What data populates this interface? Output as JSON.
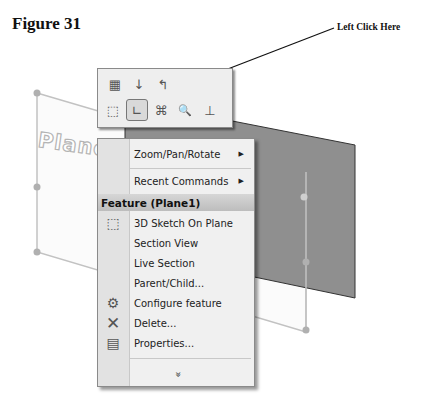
{
  "figure": {
    "label": "Figure 31"
  },
  "callout": {
    "label": "Left Click Here",
    "target": "sketch-button"
  },
  "scene": {
    "plane_label": "Plane",
    "plane_color": "#8f8f8f"
  },
  "toolbar": {
    "row1": [
      {
        "name": "edit-feature-icon",
        "glyph": "▦"
      },
      {
        "name": "rollback-icon",
        "glyph": "↓"
      },
      {
        "name": "undo-icon",
        "glyph": "↰"
      }
    ],
    "row2": [
      {
        "name": "select-other-icon",
        "glyph": "⬚"
      },
      {
        "name": "sketch-icon",
        "glyph": "∟",
        "active": true
      },
      {
        "name": "normal-to-icon",
        "glyph": "⌘"
      },
      {
        "name": "zoom-to-selection-icon",
        "glyph": "🔍"
      },
      {
        "name": "normal-axis-icon",
        "glyph": "⊥"
      }
    ]
  },
  "menu": {
    "items_top": [
      {
        "label": "Zoom/Pan/Rotate",
        "submenu": true
      },
      {
        "label": "Recent Commands",
        "submenu": true,
        "mnemonic": "R"
      }
    ],
    "header": "Feature (Plane1)",
    "items": [
      {
        "label": "3D Sketch On Plane",
        "icon": "3d-sketch-icon"
      },
      {
        "label": "Section View"
      },
      {
        "label": "Live Section"
      },
      {
        "label": "Parent/Child..."
      },
      {
        "label": "Configure feature",
        "icon": "configure-icon"
      },
      {
        "label": "Delete...",
        "icon": "delete-icon"
      },
      {
        "label": "Properties...",
        "icon": "properties-icon"
      }
    ],
    "more_glyph": "»"
  }
}
